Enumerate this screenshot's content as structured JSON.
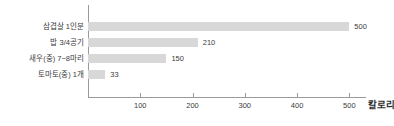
{
  "chart_data": {
    "type": "bar",
    "orientation": "horizontal",
    "title": "",
    "subtitle": "",
    "xlabel": "칼로리",
    "ylabel": "",
    "categories": [
      "삼겹살 1인분",
      "밥 3/4공기",
      "새우(중) 7~8마리",
      "토마토(중) 1개"
    ],
    "values": [
      500,
      210,
      150,
      33
    ],
    "value_labels": [
      "500",
      "210",
      "150",
      "33"
    ],
    "series": [
      {
        "name": "칼로리",
        "values": [
          500,
          210,
          150,
          33
        ]
      }
    ],
    "xlim": [
      0,
      530
    ],
    "xticks": [
      100,
      200,
      300,
      400,
      500
    ],
    "xtick_labels": [
      "100",
      "200",
      "300",
      "400",
      "500"
    ],
    "grid": false,
    "legend": false,
    "legend_position": "none",
    "bar_color": "#d8d8d8",
    "axis_color": "#9a9a9a",
    "text_color": "#3b3b3b"
  },
  "axis_title_label": "칼로리"
}
